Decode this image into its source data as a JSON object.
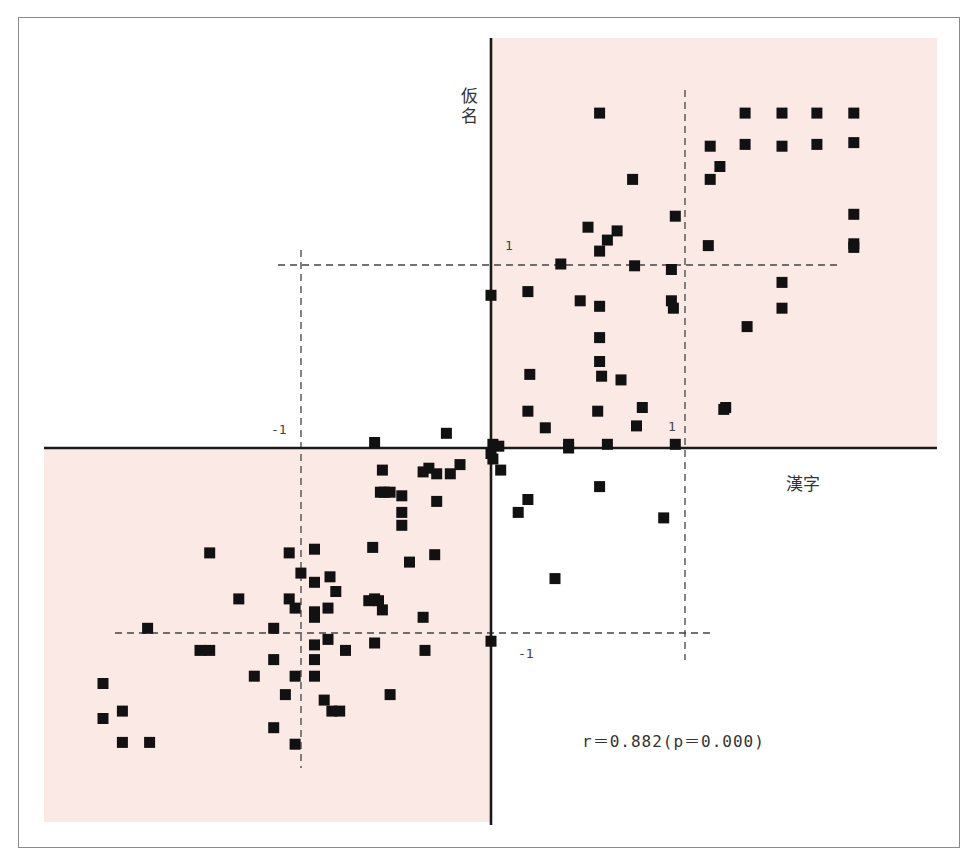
{
  "chart_data": {
    "type": "scatter",
    "title": "",
    "xlabel": "漢字",
    "ylabel": "仮名",
    "annotation": "r＝0.882(p＝0.000)",
    "tick_labels": {
      "x_pos": "1",
      "x_neg": "-1",
      "y_pos": "1",
      "y_neg": "-1"
    },
    "xlim": [
      -2.31,
      2.32
    ],
    "ylim": [
      -2.05,
      2.22
    ],
    "grid": false,
    "reference_lines": {
      "x": [
        -1,
        1
      ],
      "y": [
        -1,
        1
      ],
      "style": "dashed"
    },
    "highlighted_quadrants": [
      "upper-right",
      "lower-left"
    ],
    "colors": {
      "quadrant_fill": "#fbe9e6",
      "marker": "#111111",
      "axis": "#1a1a1a",
      "dashed": "#444444",
      "frame": "#8a8a8a"
    },
    "marker": "square",
    "points": [
      [
        0.56,
        1.82
      ],
      [
        1.31,
        1.82
      ],
      [
        1.5,
        1.82
      ],
      [
        1.68,
        1.82
      ],
      [
        1.87,
        1.82
      ],
      [
        1.13,
        1.64
      ],
      [
        1.31,
        1.65
      ],
      [
        1.5,
        1.64
      ],
      [
        1.68,
        1.65
      ],
      [
        1.87,
        1.66
      ],
      [
        1.18,
        1.53
      ],
      [
        1.13,
        1.46
      ],
      [
        0.73,
        1.46
      ],
      [
        0.5,
        1.2
      ],
      [
        0.65,
        1.18
      ],
      [
        0.6,
        1.13
      ],
      [
        0.56,
        1.07
      ],
      [
        0.95,
        1.26
      ],
      [
        1.87,
        1.27
      ],
      [
        1.87,
        1.11
      ],
      [
        1.87,
        1.09
      ],
      [
        1.12,
        1.1
      ],
      [
        0.36,
        1.0
      ],
      [
        0.74,
        0.99
      ],
      [
        0.93,
        0.97
      ],
      [
        1.5,
        0.9
      ],
      [
        1.5,
        0.76
      ],
      [
        1.32,
        0.66
      ],
      [
        0.0,
        0.83
      ],
      [
        0.19,
        0.85
      ],
      [
        0.46,
        0.8
      ],
      [
        0.56,
        0.77
      ],
      [
        0.93,
        0.8
      ],
      [
        0.94,
        0.76
      ],
      [
        0.56,
        0.6
      ],
      [
        0.56,
        0.47
      ],
      [
        0.57,
        0.39
      ],
      [
        0.2,
        0.4
      ],
      [
        0.67,
        0.37
      ],
      [
        0.19,
        0.2
      ],
      [
        0.55,
        0.2
      ],
      [
        0.78,
        0.22
      ],
      [
        1.21,
        0.22
      ],
      [
        1.2,
        0.21
      ],
      [
        0.75,
        0.12
      ],
      [
        0.28,
        0.11
      ],
      [
        0.4,
        0.02
      ],
      [
        0.4,
        0.0
      ],
      [
        0.6,
        0.02
      ],
      [
        0.95,
        0.02
      ],
      [
        0.01,
        0.02
      ],
      [
        0.04,
        0.01
      ],
      [
        0.0,
        -0.03
      ],
      [
        0.01,
        -0.06
      ],
      [
        0.05,
        -0.12
      ],
      [
        0.56,
        -0.21
      ],
      [
        0.19,
        -0.28
      ],
      [
        0.14,
        -0.35
      ],
      [
        0.89,
        -0.38
      ],
      [
        0.33,
        -0.71
      ],
      [
        0.0,
        -1.05
      ],
      [
        -0.6,
        0.03
      ],
      [
        -0.23,
        0.08
      ],
      [
        -0.56,
        -0.12
      ],
      [
        -0.32,
        -0.11
      ],
      [
        -0.35,
        -0.13
      ],
      [
        -0.16,
        -0.09
      ],
      [
        -0.21,
        -0.14
      ],
      [
        -0.28,
        -0.14
      ],
      [
        -0.57,
        -0.24
      ],
      [
        -0.55,
        -0.24
      ],
      [
        -0.52,
        -0.24
      ],
      [
        -0.46,
        -0.26
      ],
      [
        -0.46,
        -0.35
      ],
      [
        -0.46,
        -0.42
      ],
      [
        -0.28,
        -0.29
      ],
      [
        -0.61,
        -0.54
      ],
      [
        -0.29,
        -0.58
      ],
      [
        -0.42,
        -0.62
      ],
      [
        -1.45,
        -0.57
      ],
      [
        -1.04,
        -0.57
      ],
      [
        -0.91,
        -0.55
      ],
      [
        -0.98,
        -0.68
      ],
      [
        -0.91,
        -0.73
      ],
      [
        -0.83,
        -0.7
      ],
      [
        -1.3,
        -0.82
      ],
      [
        -1.04,
        -0.82
      ],
      [
        -1.01,
        -0.87
      ],
      [
        -0.84,
        -0.87
      ],
      [
        -0.91,
        -0.89
      ],
      [
        -0.91,
        -0.92
      ],
      [
        -0.8,
        -0.78
      ],
      [
        -0.63,
        -0.83
      ],
      [
        -0.58,
        -0.83
      ],
      [
        -0.6,
        -0.82
      ],
      [
        -0.56,
        -0.88
      ],
      [
        -0.35,
        -0.92
      ],
      [
        -1.12,
        -0.98
      ],
      [
        -1.77,
        -0.98
      ],
      [
        -0.84,
        -1.04
      ],
      [
        -0.6,
        -1.06
      ],
      [
        -1.5,
        -1.1
      ],
      [
        -1.45,
        -1.1
      ],
      [
        -0.75,
        -1.1
      ],
      [
        -0.34,
        -1.1
      ],
      [
        -1.12,
        -1.15
      ],
      [
        -0.91,
        -1.15
      ],
      [
        -0.91,
        -1.07
      ],
      [
        -1.22,
        -1.24
      ],
      [
        -1.01,
        -1.24
      ],
      [
        -0.91,
        -1.24
      ],
      [
        -2.0,
        -1.28
      ],
      [
        -1.06,
        -1.34
      ],
      [
        -0.52,
        -1.34
      ],
      [
        -0.86,
        -1.37
      ],
      [
        -0.82,
        -1.43
      ],
      [
        -0.78,
        -1.43
      ],
      [
        -1.9,
        -1.43
      ],
      [
        -2.0,
        -1.47
      ],
      [
        -1.12,
        -1.52
      ],
      [
        -1.9,
        -1.6
      ],
      [
        -1.76,
        -1.6
      ],
      [
        -1.01,
        -1.61
      ]
    ]
  }
}
